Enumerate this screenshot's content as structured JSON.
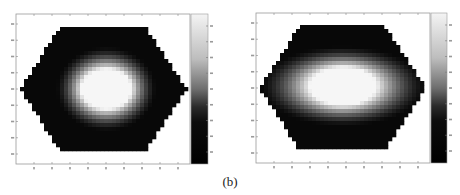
{
  "figure": {
    "caption": "(b)"
  },
  "chart_data": [
    {
      "type": "heatmap",
      "title": "",
      "xlabel": "",
      "ylabel": "",
      "colormap": "gray",
      "domain_shape": "hexagon",
      "x_tick_count": 9,
      "y_tick_count": 9,
      "colorbar_tick_count": 9,
      "tick_labels_legible": false,
      "distribution": {
        "center_x": 0.52,
        "center_y": 0.5,
        "core_radius_x": 0.15,
        "core_radius_y": 0.16,
        "falloff_radius_x": 0.3,
        "falloff_radius_y": 0.34,
        "background_value": 0.0,
        "peak_value": 1.0
      },
      "colorbar": {
        "position": "right",
        "low_color": "#000000",
        "high_color": "#f4f4f4"
      }
    },
    {
      "type": "heatmap",
      "title": "",
      "xlabel": "",
      "ylabel": "",
      "colormap": "gray",
      "domain_shape": "hexagon",
      "x_tick_count": 9,
      "y_tick_count": 9,
      "colorbar_tick_count": 9,
      "tick_labels_legible": false,
      "distribution": {
        "center_x": 0.5,
        "center_y": 0.49,
        "core_radius_x": 0.2,
        "core_radius_y": 0.15,
        "falloff_radius_x": 0.5,
        "falloff_radius_y": 0.32,
        "background_value": 0.0,
        "peak_value": 1.0
      },
      "colorbar": {
        "position": "right",
        "low_color": "#000000",
        "high_color": "#f4f4f4"
      }
    }
  ]
}
